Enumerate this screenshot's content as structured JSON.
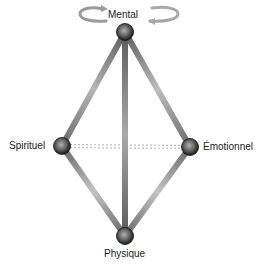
{
  "diagram": {
    "nodes": [
      {
        "id": "mental",
        "label": "Mental",
        "x": 125,
        "y": 32
      },
      {
        "id": "spirituel",
        "label": "Spirituel",
        "x": 62,
        "y": 146
      },
      {
        "id": "emotionnel",
        "label": "Émotionnel",
        "x": 190,
        "y": 147
      },
      {
        "id": "physique",
        "label": "Physique",
        "x": 125,
        "y": 236
      }
    ],
    "edges": [
      {
        "from": "mental",
        "to": "spirituel",
        "style": "solid"
      },
      {
        "from": "mental",
        "to": "emotionnel",
        "style": "solid"
      },
      {
        "from": "mental",
        "to": "physique",
        "style": "solid"
      },
      {
        "from": "spirituel",
        "to": "physique",
        "style": "solid"
      },
      {
        "from": "emotionnel",
        "to": "physique",
        "style": "solid"
      },
      {
        "from": "spirituel",
        "to": "emotionnel",
        "style": "dotted"
      }
    ],
    "decorations": {
      "mental_arrows": "circular-arrows-icon"
    },
    "colors": {
      "beam_dark": "#6a6a6a",
      "beam_light": "#d0d0d0",
      "sphere_dark": "#1a1a1a",
      "sphere_light": "#9a9a9a",
      "dotted": "#bdbdbd"
    }
  }
}
